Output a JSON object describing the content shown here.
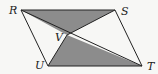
{
  "diagram": {
    "type": "geometry-parallelogram",
    "background": "#f7f7f5",
    "stroke_color": "#222222",
    "shade_color": "#8c8c8c",
    "points": {
      "R": {
        "x": 21,
        "y": 10,
        "label": "R",
        "lx": 9,
        "ly": 14
      },
      "S": {
        "x": 115,
        "y": 10,
        "label": "S",
        "lx": 121,
        "ly": 15
      },
      "T": {
        "x": 142,
        "y": 66,
        "label": "T",
        "lx": 147,
        "ly": 70
      },
      "U": {
        "x": 48,
        "y": 66,
        "label": "U",
        "lx": 35,
        "ly": 69
      },
      "V": {
        "x": 67,
        "y": 35,
        "label": "V",
        "lx": 55,
        "ly": 41
      }
    },
    "shaded_regions": [
      "triangle RSV",
      "triangle UVT"
    ],
    "segments": [
      "RS",
      "ST",
      "TU",
      "UR",
      "RT",
      "SV",
      "VU"
    ]
  }
}
